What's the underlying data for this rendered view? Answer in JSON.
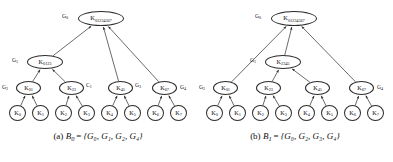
{
  "figure": {
    "type": "two-panel key-tree diagram",
    "panels": [
      {
        "id": "a",
        "caption_prefix": "(a)",
        "caption_var": "B",
        "caption_sub": "0",
        "caption_eq": "=",
        "caption_set": "{G₀, G₁, G₂, G₄}",
        "caption_full": "(a) B₀ = {G₀, G₁, G₂, G₄}",
        "nodes": [
          {
            "id": "a-root",
            "key": "K",
            "sub": "01234567",
            "level": 0,
            "x": 78,
            "y": 11,
            "class": "n-root"
          },
          {
            "id": "a-mid",
            "key": "K",
            "sub": "0123",
            "level": 1,
            "x": 27,
            "y": 55,
            "class": "n-mid"
          },
          {
            "id": "a-i01",
            "key": "K",
            "sub": "01",
            "level": 2,
            "x": 16,
            "y": 81,
            "class": "n-inner"
          },
          {
            "id": "a-i23",
            "key": "K",
            "sub": "23",
            "level": 2,
            "x": 59,
            "y": 81,
            "class": "n-inner"
          },
          {
            "id": "a-i45",
            "key": "K",
            "sub": "45",
            "level": 2,
            "x": 108,
            "y": 81,
            "class": "n-inner"
          },
          {
            "id": "a-i67",
            "key": "K",
            "sub": "67",
            "level": 2,
            "x": 152,
            "y": 81,
            "class": "n-inner"
          },
          {
            "id": "a-k0",
            "key": "K",
            "sub": "0",
            "level": 3,
            "x": 9,
            "y": 105,
            "class": "n-leaf"
          },
          {
            "id": "a-k1",
            "key": "K",
            "sub": "1",
            "level": 3,
            "x": 32,
            "y": 105,
            "class": "n-leaf"
          },
          {
            "id": "a-k2",
            "key": "K",
            "sub": "2",
            "level": 3,
            "x": 55,
            "y": 105,
            "class": "n-leaf"
          },
          {
            "id": "a-k3",
            "key": "K",
            "sub": "3",
            "level": 3,
            "x": 78,
            "y": 105,
            "class": "n-leaf"
          },
          {
            "id": "a-k4",
            "key": "K",
            "sub": "4",
            "level": 3,
            "x": 101,
            "y": 105,
            "class": "n-leaf"
          },
          {
            "id": "a-k5",
            "key": "K",
            "sub": "5",
            "level": 3,
            "x": 124,
            "y": 105,
            "class": "n-leaf"
          },
          {
            "id": "a-k6",
            "key": "K",
            "sub": "6",
            "level": 3,
            "x": 147,
            "y": 105,
            "class": "n-leaf"
          },
          {
            "id": "a-k7",
            "key": "K",
            "sub": "7",
            "level": 3,
            "x": 170,
            "y": 105,
            "class": "n-leaf"
          }
        ],
        "tags": [
          {
            "id": "a-g0",
            "text": "G",
            "sub": "0",
            "x": 62,
            "y": 14
          },
          {
            "id": "a-g1",
            "text": "G",
            "sub": "1",
            "x": 12,
            "y": 58
          },
          {
            "id": "a-g2",
            "text": "G",
            "sub": "2",
            "x": 2,
            "y": 85
          },
          {
            "id": "a-c1",
            "text": "C",
            "sub": "1",
            "x": 86,
            "y": 83
          },
          {
            "id": "a-g3",
            "text": "G",
            "sub": "3",
            "x": 135,
            "y": 83
          },
          {
            "id": "a-g4",
            "text": "G",
            "sub": "4",
            "x": 180,
            "y": 85
          }
        ],
        "edges": [
          {
            "from": "a-mid",
            "to": "a-root"
          },
          {
            "from": "a-i45",
            "to": "a-root"
          },
          {
            "from": "a-i67",
            "to": "a-root"
          },
          {
            "from": "a-i01",
            "to": "a-mid"
          },
          {
            "from": "a-i23",
            "to": "a-mid"
          },
          {
            "from": "a-k0",
            "to": "a-i01"
          },
          {
            "from": "a-k1",
            "to": "a-i01"
          },
          {
            "from": "a-k2",
            "to": "a-i23"
          },
          {
            "from": "a-k3",
            "to": "a-i23"
          },
          {
            "from": "a-k4",
            "to": "a-i45"
          },
          {
            "from": "a-k5",
            "to": "a-i45"
          },
          {
            "from": "a-k6",
            "to": "a-i67"
          },
          {
            "from": "a-k7",
            "to": "a-i67"
          }
        ]
      },
      {
        "id": "b",
        "caption_prefix": "(b)",
        "caption_var": "B",
        "caption_sub": "1",
        "caption_eq": "=",
        "caption_set": "{G₀, G₂, G₃, G₄}",
        "caption_full": "(b) B₁ = {G₀, G₂, G₃, G₄}",
        "nodes": [
          {
            "id": "b-root",
            "key": "K",
            "sub": "01234567",
            "level": 0,
            "x": 74,
            "y": 11,
            "class": "n-root"
          },
          {
            "id": "b-mid",
            "key": "K",
            "sub": "2345",
            "level": 1,
            "x": 68,
            "y": 55,
            "class": "n-mid"
          },
          {
            "id": "b-i01",
            "key": "K",
            "sub": "01",
            "level": 2,
            "x": 16,
            "y": 81,
            "class": "n-inner"
          },
          {
            "id": "b-i23",
            "key": "K",
            "sub": "23",
            "level": 2,
            "x": 59,
            "y": 81,
            "class": "n-inner"
          },
          {
            "id": "b-i45",
            "key": "K",
            "sub": "45",
            "level": 2,
            "x": 108,
            "y": 81,
            "class": "n-inner"
          },
          {
            "id": "b-i67",
            "key": "K",
            "sub": "67",
            "level": 2,
            "x": 152,
            "y": 81,
            "class": "n-inner"
          },
          {
            "id": "b-k0",
            "key": "K",
            "sub": "0",
            "level": 3,
            "x": 9,
            "y": 105,
            "class": "n-leaf"
          },
          {
            "id": "b-k1",
            "key": "K",
            "sub": "1",
            "level": 3,
            "x": 32,
            "y": 105,
            "class": "n-leaf"
          },
          {
            "id": "b-k2",
            "key": "K",
            "sub": "2",
            "level": 3,
            "x": 55,
            "y": 105,
            "class": "n-leaf"
          },
          {
            "id": "b-k3",
            "key": "K",
            "sub": "3",
            "level": 3,
            "x": 78,
            "y": 105,
            "class": "n-leaf"
          },
          {
            "id": "b-k4",
            "key": "K",
            "sub": "4",
            "level": 3,
            "x": 101,
            "y": 105,
            "class": "n-leaf"
          },
          {
            "id": "b-k5",
            "key": "K",
            "sub": "5",
            "level": 3,
            "x": 124,
            "y": 105,
            "class": "n-leaf"
          },
          {
            "id": "b-k6",
            "key": "K",
            "sub": "6",
            "level": 3,
            "x": 147,
            "y": 105,
            "class": "n-leaf"
          },
          {
            "id": "b-k7",
            "key": "K",
            "sub": "7",
            "level": 3,
            "x": 170,
            "y": 105,
            "class": "n-leaf"
          }
        ],
        "tags": [
          {
            "id": "b-g0",
            "text": "G",
            "sub": "0",
            "x": 58,
            "y": 14
          },
          {
            "id": "b-g1",
            "text": "G",
            "sub": "1",
            "x": 53,
            "y": 58
          },
          {
            "id": "b-g2",
            "text": "G",
            "sub": "2",
            "x": 2,
            "y": 85
          },
          {
            "id": "b-g4",
            "text": "G",
            "sub": "4",
            "x": 180,
            "y": 85
          }
        ],
        "edges": [
          {
            "from": "b-i01",
            "to": "b-root"
          },
          {
            "from": "b-mid",
            "to": "b-root"
          },
          {
            "from": "b-i67",
            "to": "b-root"
          },
          {
            "from": "b-i23",
            "to": "b-mid"
          },
          {
            "from": "b-i45",
            "to": "b-mid"
          },
          {
            "from": "b-k0",
            "to": "b-i01"
          },
          {
            "from": "b-k1",
            "to": "b-i01"
          },
          {
            "from": "b-k2",
            "to": "b-i23"
          },
          {
            "from": "b-k3",
            "to": "b-i23"
          },
          {
            "from": "b-k4",
            "to": "b-i45"
          },
          {
            "from": "b-k5",
            "to": "b-i45"
          },
          {
            "from": "b-k6",
            "to": "b-i67"
          },
          {
            "from": "b-k7",
            "to": "b-i67"
          }
        ]
      }
    ],
    "style": {
      "stroke": "#2b2b2b",
      "background": "#ffffff",
      "text": "#111111"
    }
  }
}
